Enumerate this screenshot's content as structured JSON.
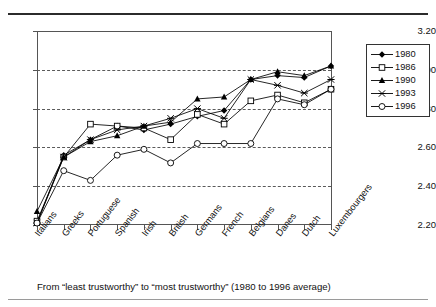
{
  "page": {
    "clipped_header_text": "",
    "caption": "From “least trustworthy” to “most trustworthy” (1980 to 1996 average)"
  },
  "legend": {
    "position": "top-right",
    "entries": [
      {
        "label": "1980",
        "marker": "filled-diamond",
        "color": "#000000"
      },
      {
        "label": "1986",
        "marker": "open-square",
        "color": "#000000"
      },
      {
        "label": "1990",
        "marker": "filled-triangle",
        "color": "#000000"
      },
      {
        "label": "1993",
        "marker": "cross-x",
        "color": "#000000"
      },
      {
        "label": "1996",
        "marker": "open-circle",
        "color": "#000000"
      }
    ]
  },
  "axis": {
    "y_ticks": [
      "3.20",
      "3.00",
      "2.80",
      "2.60",
      "2.40",
      "2.20"
    ],
    "y_values": [
      3.2,
      3.0,
      2.8,
      2.6,
      2.4,
      2.2
    ]
  },
  "chart_data": {
    "type": "line",
    "title": "",
    "subtitle": "",
    "xlabel": "",
    "ylabel": "",
    "ylim": [
      2.2,
      3.2
    ],
    "ytick_step": 0.2,
    "grid": true,
    "legend_position": "top-right",
    "categories": [
      "Italians",
      "Greeks",
      "Portuguese",
      "Spanish",
      "Irish",
      "British",
      "Germans",
      "French",
      "Belgians",
      "Danes",
      "Dutch",
      "Luxembourgers"
    ],
    "series": [
      {
        "name": "1980",
        "marker": "filled-diamond",
        "values": [
          2.21,
          2.56,
          2.64,
          2.71,
          2.69,
          2.72,
          2.76,
          2.79,
          2.95,
          2.97,
          2.96,
          3.02
        ]
      },
      {
        "name": "1986",
        "marker": "open-square",
        "values": [
          2.22,
          2.55,
          2.72,
          2.71,
          2.7,
          2.64,
          2.77,
          2.72,
          2.84,
          2.87,
          2.83,
          2.9
        ]
      },
      {
        "name": "1990",
        "marker": "filled-triangle",
        "values": [
          2.27,
          2.55,
          2.63,
          2.66,
          2.71,
          2.73,
          2.85,
          2.86,
          2.95,
          2.99,
          2.97,
          3.02
        ]
      },
      {
        "name": "1993",
        "marker": "cross-x",
        "values": [
          2.21,
          2.55,
          2.64,
          2.69,
          2.71,
          2.75,
          2.8,
          2.75,
          2.95,
          2.92,
          2.88,
          2.95
        ]
      },
      {
        "name": "1996",
        "marker": "open-circle",
        "values": [
          2.21,
          2.48,
          2.43,
          2.56,
          2.59,
          2.52,
          2.62,
          2.62,
          2.62,
          2.85,
          2.82,
          2.9
        ]
      }
    ]
  }
}
